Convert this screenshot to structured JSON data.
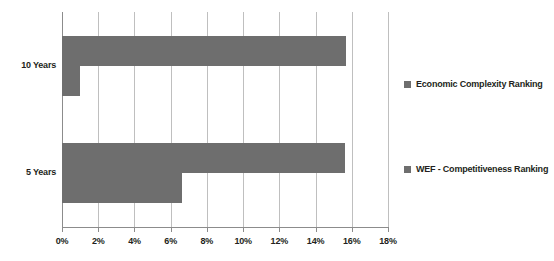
{
  "chart_data": {
    "type": "bar",
    "orientation": "horizontal",
    "title": "",
    "subtitle": "",
    "xlabel": "",
    "ylabel": "",
    "categories": [
      "10 Years",
      "5 Years"
    ],
    "series": [
      {
        "name": "Economic Complexity Ranking",
        "color": "#6e6e6e",
        "values": [
          15.7,
          15.6
        ]
      },
      {
        "name": "WEF - Competitiveness Ranking",
        "color": "#6e6e6e",
        "values": [
          1.0,
          6.6
        ]
      }
    ],
    "xlim": [
      0,
      18
    ],
    "xtick_values": [
      0,
      2,
      4,
      6,
      8,
      10,
      12,
      14,
      16,
      18
    ],
    "xtick_labels": [
      "0%",
      "2%",
      "4%",
      "6%",
      "8%",
      "10%",
      "12%",
      "14%",
      "16%",
      "18%"
    ],
    "grid": "vertical",
    "legend_position": "right",
    "legend": [
      {
        "label": "Economic Complexity Ranking",
        "color": "#6e6e6e"
      },
      {
        "label": "WEF - Competitiveness Ranking",
        "color": "#6e6e6e"
      }
    ],
    "colors": {
      "bar": "#6e6e6e",
      "gridline": "#bfbfbf",
      "axis": "#8c8c8c",
      "text": "#231f20",
      "background": "#ffffff"
    }
  }
}
